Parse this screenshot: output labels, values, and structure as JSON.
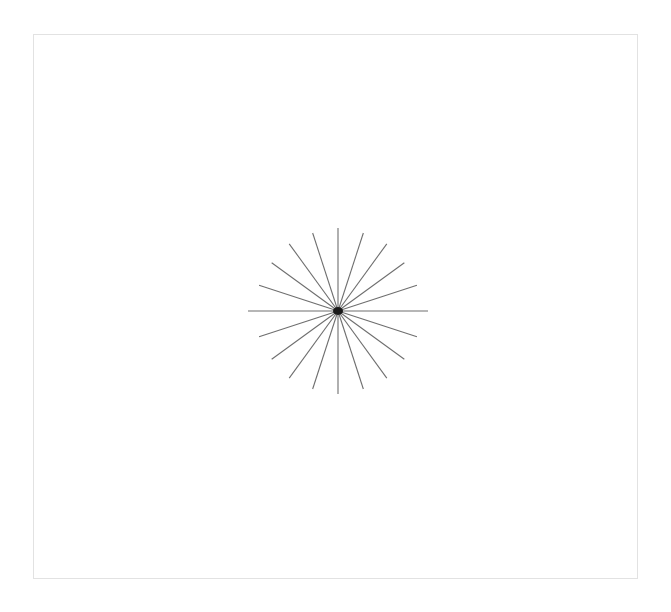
{
  "page": {
    "width": 671,
    "height": 612,
    "background_color": "#ffffff"
  },
  "frame": {
    "label": "page-border",
    "x": 33,
    "y": 34,
    "width": 605,
    "height": 545,
    "border_color": "#e2e2e2",
    "border_width": 1,
    "fill_color": "#ffffff"
  },
  "chart_data": {
    "type": "scatter",
    "title": "",
    "subtitle": "",
    "xlabel": "",
    "ylabel": "",
    "grid": false,
    "legend": null,
    "annotations": [],
    "center": {
      "x": 338,
      "y": 311
    },
    "ray_count": 20,
    "angle_step_deg": 18,
    "stroke_color": "#6e6e6e",
    "stroke_width": 1.1,
    "hub": {
      "color": "#1a1a1a",
      "radius": 5.0,
      "shape": "blob"
    },
    "xlim": [
      248,
      428
    ],
    "ylim": [
      228,
      394
    ],
    "rays": [
      {
        "index": 0,
        "angle_deg": 0,
        "length": 90,
        "label": "east"
      },
      {
        "index": 1,
        "angle_deg": 18,
        "length": 83,
        "label": ""
      },
      {
        "index": 2,
        "angle_deg": 36,
        "length": 82,
        "label": ""
      },
      {
        "index": 3,
        "angle_deg": 54,
        "length": 83,
        "label": ""
      },
      {
        "index": 4,
        "angle_deg": 72,
        "length": 82,
        "label": ""
      },
      {
        "index": 5,
        "angle_deg": 90,
        "length": 83,
        "label": "north"
      },
      {
        "index": 6,
        "angle_deg": 108,
        "length": 82,
        "label": ""
      },
      {
        "index": 7,
        "angle_deg": 126,
        "length": 83,
        "label": ""
      },
      {
        "index": 8,
        "angle_deg": 144,
        "length": 82,
        "label": ""
      },
      {
        "index": 9,
        "angle_deg": 162,
        "length": 83,
        "label": ""
      },
      {
        "index": 10,
        "angle_deg": 180,
        "length": 90,
        "label": "west"
      },
      {
        "index": 11,
        "angle_deg": 198,
        "length": 83,
        "label": ""
      },
      {
        "index": 12,
        "angle_deg": 216,
        "length": 82,
        "label": ""
      },
      {
        "index": 13,
        "angle_deg": 234,
        "length": 83,
        "label": ""
      },
      {
        "index": 14,
        "angle_deg": 252,
        "length": 82,
        "label": ""
      },
      {
        "index": 15,
        "angle_deg": 270,
        "length": 83,
        "label": "south"
      },
      {
        "index": 16,
        "angle_deg": 288,
        "length": 82,
        "label": ""
      },
      {
        "index": 17,
        "angle_deg": 306,
        "length": 83,
        "label": ""
      },
      {
        "index": 18,
        "angle_deg": 324,
        "length": 82,
        "label": ""
      },
      {
        "index": 19,
        "angle_deg": 342,
        "length": 83,
        "label": ""
      }
    ]
  }
}
